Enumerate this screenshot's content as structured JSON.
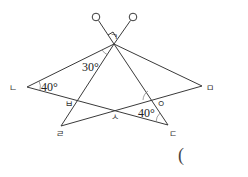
{
  "diagram": {
    "type": "geometry-figure",
    "points": {
      "giyeok": {
        "label": "ㄱ"
      },
      "nieun": {
        "label": "ㄴ"
      },
      "digeut": {
        "label": "ㄷ"
      },
      "rieul": {
        "label": "ㄹ"
      },
      "mieum": {
        "label": "ㅁ"
      },
      "bieup": {
        "label": "ㅂ"
      },
      "siot": {
        "label": "ㅅ"
      },
      "ieung": {
        "label": "ㅇ"
      }
    },
    "angles": {
      "at_nieun": "40°",
      "at_giyeok": "30°",
      "at_digeut": "40°"
    },
    "answer_paren": "("
  }
}
